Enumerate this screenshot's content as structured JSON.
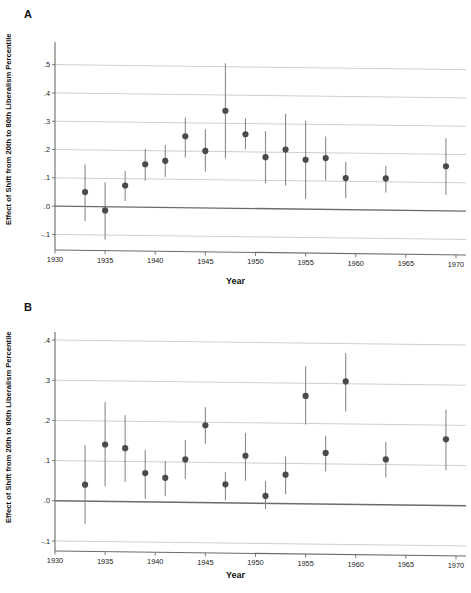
{
  "figure": {
    "panels": [
      {
        "letter": "A",
        "xlabel": "Year",
        "ylabel": "Effect of Shift from 20th to 80th Liberalism Percentile"
      },
      {
        "letter": "B",
        "xlabel": "Year",
        "ylabel": "Effect of Shift from 20th to 80th Liberalism Percentile"
      }
    ]
  },
  "chart_data": [
    {
      "type": "scatter",
      "panel": "A",
      "title": "",
      "xlabel": "Year",
      "ylabel": "Effect of Shift from 20th to 80th Liberalism Percentile",
      "xlim": [
        1930,
        1971
      ],
      "ylim": [
        -0.155,
        0.58
      ],
      "xticks": [
        1930,
        1935,
        1940,
        1945,
        1950,
        1955,
        1960,
        1965,
        1970
      ],
      "xtick_labels": [
        "1930",
        "1935",
        "1940",
        "1945",
        "1950",
        "1955",
        "1960",
        "1965",
        "1970"
      ],
      "yticks": [
        0.5,
        0.4,
        0.3,
        0.2,
        0.1,
        0.0,
        -0.1
      ],
      "ytick_labels": [
        ".5",
        ".4",
        ".3",
        ".2",
        ".1",
        ".0",
        "-.1"
      ],
      "grid": true,
      "zero_reference_line": 0.0,
      "error_bar_style": "vertical-whisker",
      "x": [
        1933,
        1935,
        1937,
        1939,
        1941,
        1943,
        1945,
        1947,
        1949,
        1951,
        1953,
        1955,
        1957,
        1959,
        1963,
        1969
      ],
      "values": [
        0.05,
        -0.015,
        0.073,
        0.148,
        0.16,
        0.247,
        0.195,
        0.337,
        0.254,
        0.173,
        0.2,
        0.164,
        0.17,
        0.099,
        0.098,
        0.141
      ],
      "ci_low": [
        -0.053,
        -0.118,
        0.018,
        0.09,
        0.104,
        0.172,
        0.122,
        0.168,
        0.201,
        0.081,
        0.073,
        0.026,
        0.091,
        0.029,
        0.048,
        0.04
      ],
      "ci_high": [
        0.147,
        0.084,
        0.124,
        0.203,
        0.216,
        0.313,
        0.272,
        0.505,
        0.311,
        0.265,
        0.326,
        0.301,
        0.246,
        0.157,
        0.143,
        0.24
      ]
    },
    {
      "type": "scatter",
      "panel": "B",
      "title": "",
      "xlabel": "Year",
      "ylabel": "Effect of Shift from 20th to 80th Liberalism Percentile",
      "xlim": [
        1930,
        1971
      ],
      "ylim": [
        -0.125,
        0.42
      ],
      "xticks": [
        1930,
        1935,
        1940,
        1945,
        1950,
        1955,
        1960,
        1965,
        1970
      ],
      "xtick_labels": [
        "1930",
        "1935",
        "1940",
        "1945",
        "1950",
        "1955",
        "1960",
        "1965",
        "1970"
      ],
      "yticks": [
        0.4,
        0.3,
        0.2,
        0.1,
        0.0,
        -0.1
      ],
      "ytick_labels": [
        ".4",
        ".3",
        ".2",
        ".1",
        ".0",
        "-.1"
      ],
      "grid": true,
      "zero_reference_line": 0.0,
      "error_bar_style": "vertical-whisker",
      "x": [
        1933,
        1935,
        1937,
        1939,
        1941,
        1943,
        1945,
        1947,
        1949,
        1951,
        1953,
        1955,
        1957,
        1959,
        1963,
        1969
      ],
      "values": [
        0.04,
        0.14,
        0.131,
        0.069,
        0.057,
        0.103,
        0.188,
        0.041,
        0.112,
        0.012,
        0.065,
        0.261,
        0.119,
        0.297,
        0.103,
        0.153
      ],
      "ci_low": [
        -0.057,
        0.036,
        0.047,
        0.005,
        0.011,
        0.054,
        0.142,
        0.001,
        0.05,
        -0.021,
        0.017,
        0.19,
        0.073,
        0.222,
        0.058,
        0.076
      ],
      "ci_high": [
        0.138,
        0.245,
        0.213,
        0.126,
        0.099,
        0.151,
        0.233,
        0.071,
        0.169,
        0.049,
        0.11,
        0.334,
        0.162,
        0.367,
        0.146,
        0.227
      ]
    }
  ]
}
